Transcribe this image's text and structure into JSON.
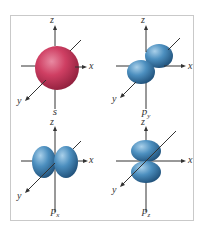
{
  "figure": {
    "panels": [
      {
        "id": "s",
        "label": "s",
        "sub": "",
        "shape": "sphere",
        "color": "#c8355a"
      },
      {
        "id": "py",
        "label": "p",
        "sub": "y",
        "shape": "lobes-y",
        "color": "#3f7fb0"
      },
      {
        "id": "px",
        "label": "p",
        "sub": "x",
        "shape": "lobes-x",
        "color": "#3f7fb0"
      },
      {
        "id": "pz",
        "label": "p",
        "sub": "z",
        "shape": "lobes-z",
        "color": "#3f7fb0"
      }
    ],
    "axes": {
      "x": "x",
      "y": "y",
      "z": "z"
    }
  },
  "colors": {
    "s_orbital": "#c8355a",
    "p_orbital": "#3f7fb0",
    "axis": "#333333",
    "frame": "#c9c9c9"
  }
}
